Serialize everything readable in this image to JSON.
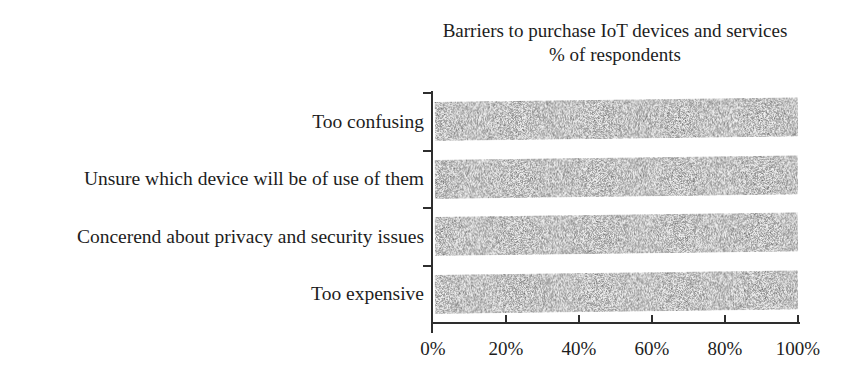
{
  "chart_data": {
    "type": "bar",
    "orientation": "horizontal",
    "title": "Barriers to purchase IoT devices and services",
    "subtitle": "% of respondents",
    "categories": [
      "Too confusing",
      "Unsure which device will be of use of them",
      "Concerend about privacy and security issues",
      "Too expensive"
    ],
    "values": [
      100,
      100,
      100,
      100
    ],
    "unit": "%",
    "xlim": [
      0,
      100
    ],
    "x_ticks": [
      "0%",
      "20%",
      "40%",
      "60%",
      "80%",
      "100%"
    ],
    "x_tick_values": [
      0,
      20,
      40,
      60,
      80,
      100
    ],
    "grid": false,
    "legend": false,
    "bar_texture": "stippled-gray-noise",
    "colors": {
      "bar": "#c6c6c6",
      "axis": "#2e2e2e",
      "text": "#1d1d1d",
      "background": "#ffffff"
    }
  }
}
